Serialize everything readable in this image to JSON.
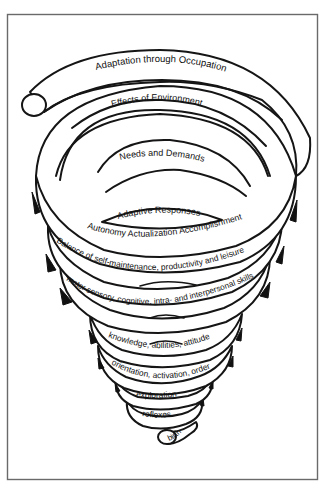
{
  "diagram": {
    "type": "spiral",
    "colors": {
      "background": "#ffffff",
      "frame": "#6a6a6a",
      "ink": "#151515"
    },
    "coils": [
      {
        "id": "adaptation",
        "label": "Adaptation through Occupation"
      },
      {
        "id": "environment",
        "label": "Effects of Environment"
      },
      {
        "id": "needs",
        "label": "Needs and Demands"
      },
      {
        "id": "adaptive-responses",
        "label": "Adaptive Responses"
      },
      {
        "id": "autonomy",
        "label": "Autonomy Actualization Accomplishment"
      },
      {
        "id": "balance",
        "label": "Balance of self-maintenance, productivity and leisure"
      },
      {
        "id": "skills",
        "label": "motor sensory, cognitive, intra- and interpersonal skills"
      },
      {
        "id": "knowledge",
        "label": "knowledge, abilities, attitude"
      },
      {
        "id": "orientation",
        "label": "orientation, activation, order"
      },
      {
        "id": "exploration",
        "label": "exploration"
      },
      {
        "id": "reflexes",
        "label": "reflexes"
      },
      {
        "id": "birth",
        "label": "birth"
      }
    ],
    "top_end": "open-tube-end-top-left",
    "bottom_end": "open-tube-end-bottom-center"
  }
}
